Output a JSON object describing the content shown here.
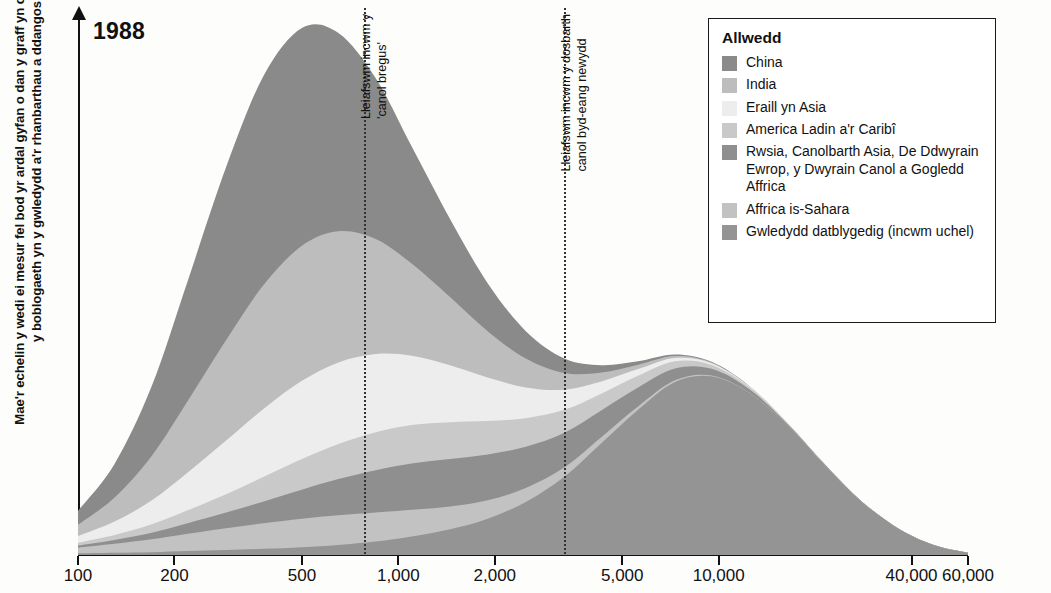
{
  "chart_title": "1988",
  "y_axis_label": "Mae'r echelin y wedi ei mesur fel bod yr ardal gyfan o dan y graff yn cyfateb â maint y boblogaeth yn y gwledydd a'r rhanbarthau a ddangosir",
  "x_ticks": [
    {
      "label": "100",
      "value": 100
    },
    {
      "label": "200",
      "value": 200
    },
    {
      "label": "500",
      "value": 500
    },
    {
      "label": "1,000",
      "value": 1000
    },
    {
      "label": "2,000",
      "value": 2000
    },
    {
      "label": "5,000",
      "value": 5000
    },
    {
      "label": "10,000",
      "value": 10000
    },
    {
      "label": "40,000",
      "value": 40000
    },
    {
      "label": "60,000",
      "value": 60000
    }
  ],
  "annotations": [
    {
      "name": "fragile-middle-line",
      "text": "Lleiafswm incwm y\n'canol bregus'",
      "line1": "Lleiafswm incwm y",
      "line2": "'canol bregus'",
      "value": 780
    },
    {
      "name": "global-middle-class-line",
      "text": "Lleiafswm incwm y dosbarth\ncanol byd-eang newydd",
      "line1": "Lleiafswm incwm y dosbarth",
      "line2": "canol byd-eang newydd",
      "value": 3300
    }
  ],
  "legend": {
    "title": "Allwedd",
    "items": [
      {
        "label": "China",
        "color": "#8a8a8a"
      },
      {
        "label": "India",
        "color": "#bdbdbd"
      },
      {
        "label": "Eraill yn Asia",
        "color": "#ededed"
      },
      {
        "label": "America Ladin a'r Caribî",
        "color": "#c9c9c9"
      },
      {
        "label": "Rwsia, Canolbarth Asia, De Ddwyrain Ewrop, y Dwyrain Canol a Gogledd Affrica",
        "color": "#8f8f8f"
      },
      {
        "label": "Affrica is-Sahara",
        "color": "#c2c2c2"
      },
      {
        "label": "Gwledydd datblygedig (incwm uchel)",
        "color": "#949494"
      }
    ]
  },
  "colors": {
    "axis": "#111111",
    "background": "#fdfdfb",
    "dotted_line": "#333333",
    "band_china": "#8a8a8a",
    "band_india": "#bdbdbd",
    "band_other_asia": "#ededed",
    "band_latin_america": "#c9c9c9",
    "band_russia": "#8f8f8f",
    "band_africa": "#c2c2c2",
    "band_developed": "#949494"
  },
  "chart_data": {
    "type": "area",
    "title": "1988",
    "xlabel": "",
    "ylabel": "Mae'r echelin y wedi ei mesur fel bod yr ardal gyfan o dan y graff yn cyfateb â maint y boblogaeth yn y gwledydd a'r rhanbarthau a ddangosir",
    "xscale": "log",
    "xlim": [
      100,
      60000
    ],
    "ylim": [
      0,
      100
    ],
    "grid": false,
    "legend_position": "top-right",
    "stacked": true,
    "x": [
      100,
      130,
      170,
      220,
      290,
      380,
      500,
      650,
      850,
      1100,
      1450,
      1900,
      2500,
      3300,
      4300,
      5600,
      7300,
      9500,
      12500,
      16500,
      21500,
      28000,
      37000,
      48000,
      60000
    ],
    "series": [
      {
        "name": "Gwledydd datblygedig (incwm uchel)",
        "color": "#949494",
        "values": [
          0.3,
          0.4,
          0.5,
          0.7,
          0.9,
          1.1,
          1.4,
          1.8,
          2.4,
          3.3,
          4.6,
          6.5,
          9.5,
          14.0,
          20.0,
          26.0,
          31.0,
          32.0,
          29.0,
          23.0,
          16.0,
          9.5,
          4.5,
          1.6,
          0.4
        ]
      },
      {
        "name": "Affrica is-Sahara",
        "color": "#c2c2c2",
        "values": [
          1.0,
          1.6,
          2.3,
          3.1,
          3.9,
          4.6,
          5.1,
          5.3,
          5.2,
          4.8,
          4.1,
          3.3,
          2.5,
          1.7,
          1.1,
          0.6,
          0.3,
          0.15,
          0.05,
          0.02,
          0.0,
          0.0,
          0.0,
          0.0,
          0.0
        ]
      },
      {
        "name": "Rwsia, Canolbarth Asia, De Ddwyrain Ewrop, y Dwyrain Canol a Gogledd Affrica",
        "color": "#8f8f8f",
        "values": [
          0.4,
          0.7,
          1.2,
          1.9,
          2.8,
          3.9,
          5.2,
          6.5,
          7.6,
          8.3,
          8.5,
          8.2,
          7.4,
          6.2,
          4.8,
          3.4,
          2.1,
          1.2,
          0.6,
          0.25,
          0.1,
          0.03,
          0.0,
          0.0,
          0.0
        ]
      },
      {
        "name": "America Ladin a'r Caribî",
        "color": "#c9c9c9",
        "values": [
          0.5,
          0.9,
          1.5,
          2.3,
          3.3,
          4.4,
          5.5,
          6.3,
          6.8,
          6.9,
          6.6,
          6.0,
          5.1,
          4.1,
          3.0,
          2.1,
          1.3,
          0.7,
          0.35,
          0.15,
          0.05,
          0.0,
          0.0,
          0.0,
          0.0
        ]
      },
      {
        "name": "Eraill yn Asia",
        "color": "#ededed",
        "values": [
          1.2,
          2.4,
          4.3,
          6.8,
          9.6,
          12.2,
          14.0,
          14.6,
          14.0,
          12.4,
          10.2,
          7.8,
          5.5,
          3.6,
          2.2,
          1.2,
          0.6,
          0.3,
          0.12,
          0.04,
          0.0,
          0.0,
          0.0,
          0.0,
          0.0
        ]
      },
      {
        "name": "India",
        "color": "#bdbdbd",
        "values": [
          2.0,
          4.3,
          8.0,
          12.8,
          18.0,
          22.2,
          24.2,
          23.5,
          20.6,
          16.5,
          12.2,
          8.3,
          5.2,
          3.0,
          1.6,
          0.8,
          0.35,
          0.15,
          0.05,
          0.0,
          0.0,
          0.0,
          0.0,
          0.0,
          0.0
        ]
      },
      {
        "name": "China",
        "color": "#8a8a8a",
        "values": [
          2.5,
          6.0,
          12.5,
          21.5,
          31.0,
          37.5,
          39.0,
          35.5,
          28.8,
          21.0,
          14.0,
          8.6,
          4.9,
          2.6,
          1.3,
          0.6,
          0.25,
          0.1,
          0.03,
          0.0,
          0.0,
          0.0,
          0.0,
          0.0,
          0.0
        ]
      }
    ]
  }
}
